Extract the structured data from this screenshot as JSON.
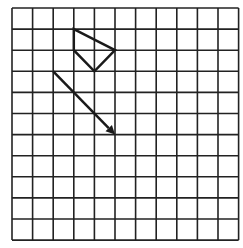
{
  "grid": {
    "cols": 11,
    "rows": 11,
    "origin": [
      12,
      8
    ],
    "cell_w": 20.6,
    "cell_h": 21.1,
    "line_color": "#222222",
    "background": "#ffffff"
  },
  "shapes": {
    "quadrilateral": {
      "points": [
        [
          3,
          1
        ],
        [
          5,
          2
        ],
        [
          4,
          3
        ],
        [
          3,
          2
        ]
      ],
      "stroke": "#1a1a1a"
    },
    "arrow": {
      "from": [
        2,
        3
      ],
      "to": [
        5,
        6
      ],
      "stroke": "#1a1a1a"
    }
  }
}
